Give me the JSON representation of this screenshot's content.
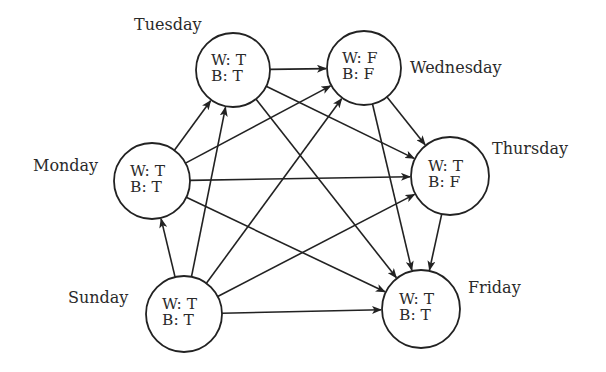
{
  "diagram": {
    "type": "directed-acyclic-graph",
    "stroke_color": "#222222",
    "background": "#ffffff",
    "nodes": [
      {
        "id": "sunday",
        "label": "Sunday",
        "w": "W: T",
        "b": "B: T",
        "cx": 184,
        "cy": 314,
        "r": 38,
        "label_x": 68,
        "label_y": 290
      },
      {
        "id": "monday",
        "label": "Monday",
        "w": "W: T",
        "b": "B: T",
        "cx": 152,
        "cy": 181,
        "r": 38,
        "label_x": 33,
        "label_y": 158
      },
      {
        "id": "tuesday",
        "label": "Tuesday",
        "w": "W: T",
        "b": "B: T",
        "cx": 233,
        "cy": 70,
        "r": 37,
        "label_x": 134,
        "label_y": 17
      },
      {
        "id": "wednesday",
        "label": "Wednesday",
        "w": "W: F",
        "b": "B: F",
        "cx": 364,
        "cy": 68,
        "r": 37,
        "label_x": 410,
        "label_y": 60
      },
      {
        "id": "thursday",
        "label": "Thursday",
        "w": "W: T",
        "b": "B: F",
        "cx": 450,
        "cy": 176,
        "r": 39,
        "label_x": 492,
        "label_y": 141
      },
      {
        "id": "friday",
        "label": "Friday",
        "w": "W: T",
        "b": "B: T",
        "cx": 421,
        "cy": 309,
        "r": 39,
        "label_x": 468,
        "label_y": 280
      }
    ],
    "edges": [
      [
        "sunday",
        "monday"
      ],
      [
        "sunday",
        "tuesday"
      ],
      [
        "sunday",
        "wednesday"
      ],
      [
        "sunday",
        "thursday"
      ],
      [
        "sunday",
        "friday"
      ],
      [
        "monday",
        "tuesday"
      ],
      [
        "monday",
        "wednesday"
      ],
      [
        "monday",
        "thursday"
      ],
      [
        "monday",
        "friday"
      ],
      [
        "tuesday",
        "wednesday"
      ],
      [
        "tuesday",
        "thursday"
      ],
      [
        "tuesday",
        "friday"
      ],
      [
        "wednesday",
        "thursday"
      ],
      [
        "wednesday",
        "friday"
      ],
      [
        "thursday",
        "friday"
      ]
    ]
  }
}
